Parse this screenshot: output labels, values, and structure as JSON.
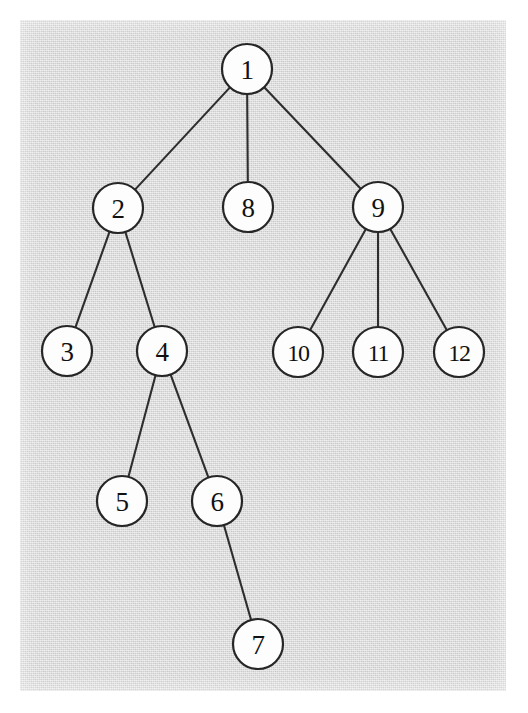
{
  "figure": {
    "kind": "rooted-tree-diagram",
    "title": "",
    "panel": {
      "background_color": "#d7d7d7",
      "page_color": "#ffffff",
      "x": 20,
      "y": 20,
      "width": 486,
      "height": 671
    },
    "style": {
      "node_fill": "#fdfdfd",
      "node_stroke": "#262626",
      "node_stroke_width": 2.2,
      "node_radius": 25,
      "edge_color": "#2e2e2e",
      "edge_width": 2.1,
      "label_color": "#111111"
    }
  },
  "chart_data": {
    "type": "diagram",
    "title": "",
    "root": "1",
    "nodes": [
      {
        "id": "1",
        "label": "1",
        "cx": 247,
        "cy": 69,
        "r": 25,
        "depth": 0
      },
      {
        "id": "2",
        "label": "2",
        "cx": 118,
        "cy": 208,
        "r": 25,
        "depth": 1
      },
      {
        "id": "8",
        "label": "8",
        "cx": 248,
        "cy": 207,
        "r": 25,
        "depth": 1
      },
      {
        "id": "9",
        "label": "9",
        "cx": 378,
        "cy": 207,
        "r": 25,
        "depth": 1
      },
      {
        "id": "3",
        "label": "3",
        "cx": 67,
        "cy": 351,
        "r": 25,
        "depth": 2
      },
      {
        "id": "4",
        "label": "4",
        "cx": 162,
        "cy": 351,
        "r": 25,
        "depth": 2
      },
      {
        "id": "10",
        "label": "10",
        "cx": 298,
        "cy": 352,
        "r": 25,
        "depth": 2
      },
      {
        "id": "11",
        "label": "11",
        "cx": 378,
        "cy": 352,
        "r": 25,
        "depth": 2
      },
      {
        "id": "12",
        "label": "12",
        "cx": 459,
        "cy": 352,
        "r": 25,
        "depth": 2
      },
      {
        "id": "5",
        "label": "5",
        "cx": 122,
        "cy": 501,
        "r": 25,
        "depth": 3
      },
      {
        "id": "6",
        "label": "6",
        "cx": 217,
        "cy": 501,
        "r": 25,
        "depth": 3
      },
      {
        "id": "7",
        "label": "7",
        "cx": 258,
        "cy": 644,
        "r": 25,
        "depth": 4
      }
    ],
    "edges": [
      {
        "from": "1",
        "to": "2"
      },
      {
        "from": "1",
        "to": "8"
      },
      {
        "from": "1",
        "to": "9"
      },
      {
        "from": "2",
        "to": "3"
      },
      {
        "from": "2",
        "to": "4"
      },
      {
        "from": "9",
        "to": "10"
      },
      {
        "from": "9",
        "to": "11"
      },
      {
        "from": "9",
        "to": "12"
      },
      {
        "from": "4",
        "to": "5"
      },
      {
        "from": "4",
        "to": "6"
      },
      {
        "from": "6",
        "to": "7"
      }
    ],
    "node_count": 12,
    "edge_count": 11,
    "depth_levels": 5
  }
}
